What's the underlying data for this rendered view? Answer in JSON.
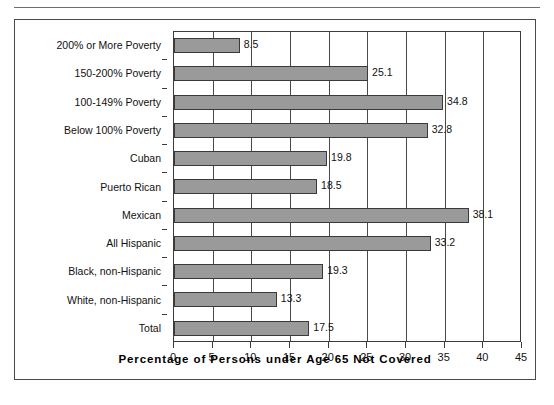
{
  "figure": {
    "background_color": "#ffffff",
    "frame_color": "#4a4a4a",
    "bar_color": "#9a9a9a",
    "bar_border_color": "#3a3a3a"
  },
  "chart_data": {
    "type": "bar",
    "orientation": "horizontal",
    "title": "",
    "subtitle": "",
    "xlabel": "Percentage of Persons under Age 65 Not Covered",
    "ylabel": "",
    "xlim": [
      0,
      45
    ],
    "xticks": [
      0,
      5,
      10,
      15,
      20,
      25,
      30,
      35,
      40,
      45
    ],
    "xtick_labels": [
      "0",
      "5",
      "10",
      "15",
      "20",
      "25",
      "30",
      "35",
      "40",
      "45"
    ],
    "grid": true,
    "grid_axis": "x",
    "legend": false,
    "legend_position": "none",
    "value_labels": true,
    "categories": [
      "200% or More Poverty",
      "150-200% Poverty",
      "100-149% Poverty",
      "Below 100% Poverty",
      "Cuban",
      "Puerto Rican",
      "Mexican",
      "All Hispanic",
      "Black, non-Hispanic",
      "White, non-Hispanic",
      "Total"
    ],
    "values": [
      8.5,
      25.1,
      34.8,
      32.8,
      19.8,
      18.5,
      38.1,
      33.2,
      19.3,
      13.3,
      17.5
    ],
    "value_label_text": [
      "8.5",
      "25.1",
      "34.8",
      "32.8",
      "19.8",
      "18.5",
      "38.1",
      "33.2",
      "19.3",
      "13.3",
      "17.5"
    ]
  }
}
